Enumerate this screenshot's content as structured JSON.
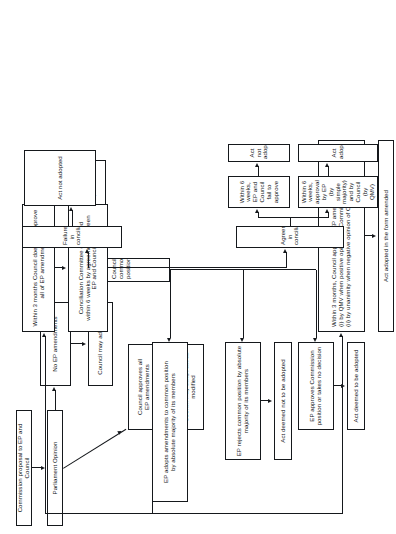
{
  "diagram": {
    "orientation": "rotated-90-ccw",
    "nodes": {
      "commission_proposal": "Commission proposal to EP and Council",
      "parliament_opinion": "Parliament Opinion",
      "no_ep_amendments": "No EP amendments",
      "council_approves_all": "Council approves all\nEP amendments",
      "council_may_adopt_act": "Council may adopt act",
      "council_may_adopt_modified": "Council may adopt act as\nmodified",
      "council_common_position": "Council common position",
      "commission_view": "Commission view on\ncommon position",
      "ep_approves_commission": "EP approves Commission\nposition or takes no decision",
      "ep_rejects_common_position": "EP rejects common position by absolute\nmajority of its members",
      "ep_adopts_amendments": "EP adopts amendments to common position\nby absolute majority of its members",
      "act_deemed_to_be_adopted": "Act deemed to be adopted",
      "act_deemed_not_to_be_adopted": "Act deemed not to be adopted",
      "within_3_months_council_approves": "Within 3 months, Council approves EP amendments:\n(i) by QMV when positive opinion of Commission;\n(ii) by unanimity when negative opinion of Commission",
      "within_3_months_council_does_not": "Within 3 months Council does not approve\nall of EP amendments",
      "act_adopted_in_form_amended": "Act adopted in the form amended",
      "conciliation_committee": "Conciliation Committee convened\nwithin 6 weeks by agreement between\nEP and Council",
      "agreement_in_conciliation": "Agreement in conciliation",
      "failure_in_conciliation": "Failure in conciliation",
      "within_6_weeks_approval": "Within 6 weeks, approval by EP\n(by simple majority) and by\nCouncil (by QMV)",
      "within_6_weeks_fail": "Within 6 weeks, EP and\nCouncil fail to approve",
      "act_adopted": "Act adopted",
      "act_not_adopted_fail": "Act not adopted",
      "act_not_adopted_failure": "Act not adopted"
    }
  }
}
